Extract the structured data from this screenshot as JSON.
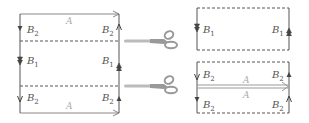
{
  "diagram": {
    "left_panel": {
      "edge_labels": {
        "top": "A",
        "bottom": "A"
      },
      "side_labels_left": [
        {
          "base": "B",
          "sub": "2"
        },
        {
          "base": "B",
          "sub": "1"
        },
        {
          "base": "B",
          "sub": "2"
        }
      ],
      "side_labels_right": [
        {
          "base": "B",
          "sub": "2"
        },
        {
          "base": "B",
          "sub": "1"
        },
        {
          "base": "B",
          "sub": "2"
        }
      ],
      "cut_lines": 2,
      "scissors_icons": 2
    },
    "right_panel": {
      "top_piece": {
        "left_label": {
          "base": "B",
          "sub": "1"
        },
        "right_label": {
          "base": "B",
          "sub": "1"
        }
      },
      "bottom_piece": {
        "left_labels": [
          {
            "base": "B",
            "sub": "2"
          },
          {
            "base": "B",
            "sub": "2"
          }
        ],
        "right_labels": [
          {
            "base": "B",
            "sub": "2"
          },
          {
            "base": "B",
            "sub": "2"
          }
        ],
        "glued_edge_labels": [
          "A",
          "A"
        ]
      }
    },
    "colors": {
      "line": "#555555",
      "label": "#555555",
      "label_A": "#aaaaaa",
      "scissors": "#aaaaaa"
    }
  }
}
